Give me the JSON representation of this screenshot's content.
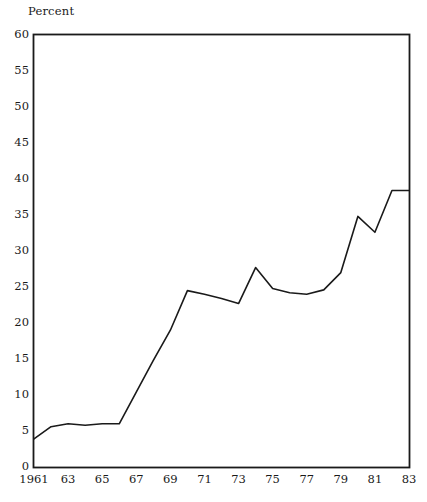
{
  "chart_data": {
    "type": "line",
    "title": "",
    "subtitle": "",
    "ylabel": "Percent",
    "xlabel": "",
    "ylim": [
      0,
      60
    ],
    "xlim": [
      1961,
      1983
    ],
    "grid": false,
    "legend": "none",
    "yticks": [
      0,
      5,
      10,
      15,
      20,
      25,
      30,
      35,
      40,
      45,
      50,
      55,
      60
    ],
    "ytick_labels": [
      "0",
      "5",
      "10",
      "15",
      "20",
      "25",
      "30",
      "35",
      "40",
      "45",
      "50",
      "55",
      "60"
    ],
    "xticks": [
      1961,
      1963,
      1965,
      1967,
      1969,
      1971,
      1973,
      1975,
      1977,
      1979,
      1981,
      1983
    ],
    "xtick_labels": [
      "1961",
      "63",
      "65",
      "67",
      "69",
      "71",
      "73",
      "75",
      "77",
      "79",
      "81",
      "83"
    ],
    "line_color": "#1a1a1a",
    "line_width": 1.6,
    "series": [
      {
        "name": "Percent",
        "x": [
          1961,
          1962,
          1963,
          1964,
          1965,
          1966,
          1967,
          1968,
          1969,
          1970,
          1971,
          1972,
          1973,
          1974,
          1975,
          1976,
          1977,
          1978,
          1979,
          1980,
          1981,
          1982,
          1983
        ],
        "values": [
          3.9,
          5.6,
          6.0,
          5.8,
          6.0,
          6.0,
          10.4,
          14.8,
          19.0,
          24.5,
          24.0,
          23.4,
          22.7,
          27.7,
          24.8,
          24.2,
          24.0,
          24.6,
          27.0,
          34.8,
          32.6,
          38.4,
          38.4
        ]
      }
    ]
  }
}
